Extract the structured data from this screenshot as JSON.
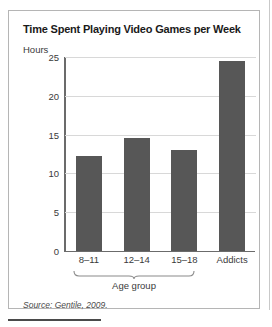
{
  "figure": {
    "title": "Time Spent Playing Video Games per Week",
    "source": "Source: Gentile, 2009.",
    "group_bracket_label": "Age group"
  },
  "colors": {
    "bar_fill": "#575757",
    "axis": "#6b6b6b",
    "gridline": "#d8d8d8",
    "border": "#b5b5b5",
    "text": "#3a3a3a"
  },
  "chart_data": {
    "type": "bar",
    "title": "Time Spent Playing Video Games per Week",
    "xlabel": "Age group",
    "ylabel": "Hours",
    "ylim": [
      0,
      25
    ],
    "yticks": [
      0,
      5,
      10,
      15,
      20,
      25
    ],
    "grid": true,
    "legend": "none",
    "categories": [
      "8–11",
      "12–14",
      "15–18",
      "Addicts"
    ],
    "values": [
      12.3,
      14.5,
      13.0,
      24.5
    ],
    "annotations": [
      "Source: Gentile, 2009."
    ]
  }
}
